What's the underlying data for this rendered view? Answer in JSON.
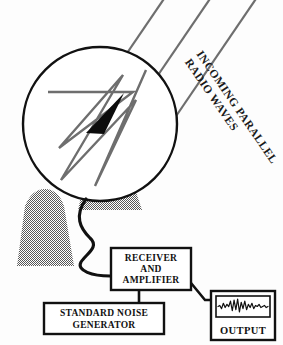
{
  "figure": {
    "background_color": "#fdfdfd",
    "ink_color": "#111111",
    "halftone_gray": "#8a8a8a",
    "ray_gray": "#6e6e6e"
  },
  "annotations": {
    "incoming_waves_line1": "INCOMING PARALLEL",
    "incoming_waves_line2": "RADIO WAVES"
  },
  "boxes": {
    "receiver": {
      "line1": "RECEIVER",
      "line2": "AND",
      "line3": "AMPLIFIER"
    },
    "noise_generator": {
      "line1": "STANDARD NOISE",
      "line2": "GENERATOR"
    },
    "output": {
      "label": "OUTPUT"
    }
  },
  "components": {
    "dish_name": "parabolic-dish-reflector",
    "feed_horn_name": "feed-horn-cone",
    "pedestal_name": "antenna-pedestal",
    "mount_name": "dish-mount",
    "cable_name": "signal-cable",
    "ray_path_name": "reflected-ray-path"
  },
  "chart_data": {
    "type": "line",
    "title": "OUTPUT",
    "xlabel": "",
    "ylabel": "",
    "series": [
      {
        "name": "noise-trace",
        "values": [
          0,
          1,
          -2,
          3,
          -1,
          2,
          0,
          5,
          -4,
          6,
          -3,
          7,
          -5,
          4,
          -2,
          5,
          -3,
          2,
          -1,
          3,
          -2,
          1,
          0,
          2,
          -1,
          0,
          1,
          -1,
          0
        ]
      }
    ],
    "ylim": [
      -8,
      8
    ],
    "grid": false,
    "legend": "none"
  }
}
